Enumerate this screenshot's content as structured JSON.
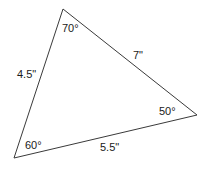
{
  "figure": {
    "name": "labeled-triangle",
    "type": "geometry-diagram",
    "background_color": "#ffffff",
    "stroke_color": "#3a3a3a",
    "text_color": "#1a1a1a",
    "stroke_width": 1
  },
  "chart_data": {
    "type": "diagram",
    "shape": "triangle",
    "title": "",
    "vertices": [
      {
        "id": "apex",
        "x": 63,
        "y": 9
      },
      {
        "id": "right",
        "x": 197,
        "y": 115
      },
      {
        "id": "bottom_left",
        "x": 14,
        "y": 158
      }
    ],
    "angles": [
      {
        "at": "apex",
        "value": 70,
        "label": "70°"
      },
      {
        "at": "right",
        "value": 50,
        "label": "50°"
      },
      {
        "at": "bottom_left",
        "value": 60,
        "label": "60°"
      }
    ],
    "sides": [
      {
        "from": "bottom_left",
        "to": "apex",
        "value": 4.5,
        "unit": "in",
        "label": "4.5\""
      },
      {
        "from": "apex",
        "to": "right",
        "value": 7,
        "unit": "in",
        "label": "7\""
      },
      {
        "from": "bottom_left",
        "to": "right",
        "value": 5.5,
        "unit": "in",
        "label": "5.5\""
      }
    ],
    "angle_sum": 180
  },
  "labels": {
    "angle_top": "70°",
    "angle_right": "50°",
    "angle_bottom_left": "60°",
    "side_left": "4.5\"",
    "side_upper_right": "7\"",
    "side_bottom": "5.5\""
  }
}
